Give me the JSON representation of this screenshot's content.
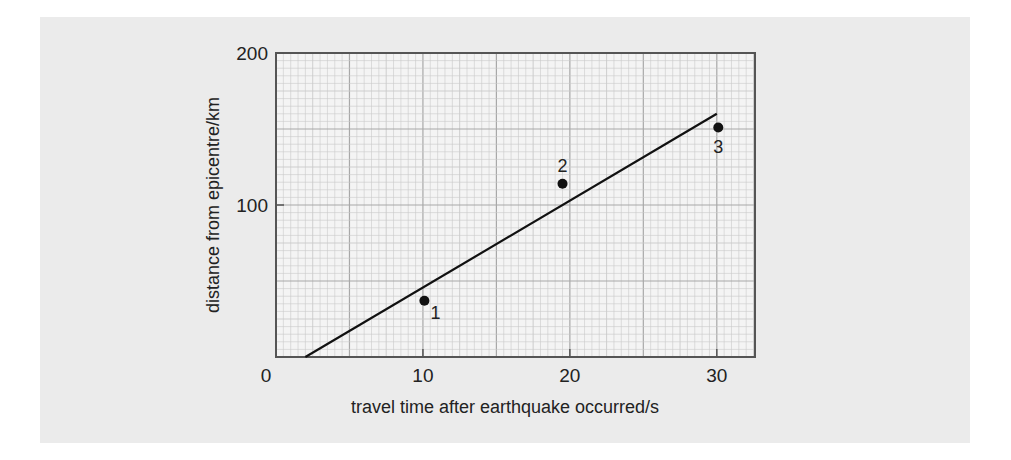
{
  "chart_data": {
    "type": "scatter",
    "title": "",
    "xlabel": "travel time after earthquake occurred/s",
    "ylabel": "distance from epicentre/km",
    "xlim": [
      0,
      32.6
    ],
    "ylim": [
      0,
      200
    ],
    "x_ticks": [
      0,
      10,
      20,
      30
    ],
    "y_ticks": [
      100,
      200
    ],
    "x_tick_labels": [
      "0",
      "10",
      "20",
      "30"
    ],
    "y_tick_labels": [
      "100",
      "200"
    ],
    "grid": true,
    "legend": null,
    "series": [
      {
        "name": "measured points",
        "type": "scatter",
        "points": [
          {
            "label": "1",
            "x": 10.1,
            "y": 37
          },
          {
            "label": "2",
            "x": 19.5,
            "y": 114
          },
          {
            "label": "3",
            "x": 30.1,
            "y": 151
          }
        ]
      },
      {
        "name": "best-fit line",
        "type": "line",
        "points": [
          {
            "x": 2.0,
            "y": 0
          },
          {
            "x": 30.0,
            "y": 160
          }
        ]
      }
    ]
  },
  "colors": {
    "panel_background": "#ebebeb",
    "plot_background": "#f4f4f4",
    "grid_minor": "#c9c9c9",
    "grid_major": "#a8a8a8",
    "axis": "#555555",
    "ink": "#111111"
  }
}
